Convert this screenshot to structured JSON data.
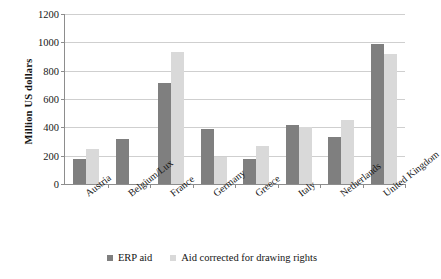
{
  "chart_data": {
    "type": "bar",
    "title": "",
    "xlabel": "",
    "ylabel": "Million US dollars",
    "ylim": [
      0,
      1200
    ],
    "y_ticks": [
      0,
      200,
      400,
      600,
      800,
      1000,
      1200
    ],
    "grid": true,
    "legend_position": "bottom",
    "categories": [
      "Austria",
      "Belgium/Lux",
      "France",
      "Germany",
      "Greece",
      "Italy",
      "Netherlands",
      "United Kingdom"
    ],
    "series": [
      {
        "name": "ERP aid",
        "color": "#7f7f7f",
        "values": [
          180,
          315,
          710,
          385,
          180,
          415,
          335,
          985
        ]
      },
      {
        "name": "Aid corrected for drawing rights",
        "color": "#d9d9d9",
        "values": [
          250,
          0,
          935,
          190,
          270,
          400,
          455,
          915
        ]
      }
    ]
  },
  "legend": {
    "items": [
      {
        "label": "ERP aid",
        "swatch": "erp"
      },
      {
        "label": "Aid corrected for drawing rights",
        "swatch": "corr"
      }
    ]
  },
  "colors": {
    "series_erp": "#7f7f7f",
    "series_corrected": "#d9d9d9",
    "axis": "#8d8d8d",
    "gridline": "#cfcfcf",
    "text": "#141414",
    "background": "#ffffff"
  }
}
